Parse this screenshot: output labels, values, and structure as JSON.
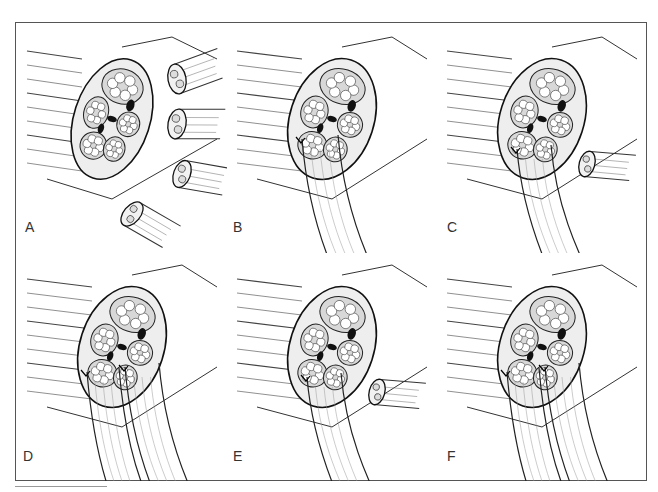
{
  "figure": {
    "panels": [
      {
        "id": "A",
        "label": "A",
        "variant": "multi-stump"
      },
      {
        "id": "B",
        "label": "B",
        "variant": "single-graft"
      },
      {
        "id": "C",
        "label": "C",
        "variant": "graft-plus-stump"
      },
      {
        "id": "D",
        "label": "D",
        "variant": "double-graft"
      },
      {
        "id": "E",
        "label": "E",
        "variant": "graft-plus-stump"
      },
      {
        "id": "F",
        "label": "F",
        "variant": "double-graft"
      }
    ]
  }
}
